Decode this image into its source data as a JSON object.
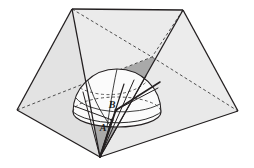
{
  "figure": {
    "background_color": "#ffffff",
    "stroke_color": "#231f20",
    "labels": [
      {
        "id": "A",
        "text": "A",
        "x": 107,
        "y": 128
      },
      {
        "id": "B",
        "text": "B",
        "x": 114,
        "y": 106
      }
    ],
    "colors": {
      "ground_plane": "#a9a9a9",
      "ground_plane_left": "#9e9e9e",
      "roof_left_face": "#e6e6e6",
      "roof_right_face": "#ededed",
      "roof_front_face": "#f2f2f2",
      "dome_fill": "#fbfbfb",
      "dome_base_fill": "#ffffff",
      "outline": "#231f20",
      "hidden_line": "#5a5a5a",
      "label_text": "#1a1a1a"
    },
    "vertices": {
      "apex_left": {
        "x": 72,
        "y": 9
      },
      "apex_right": {
        "x": 183,
        "y": 10
      },
      "base_left": {
        "x": 17,
        "y": 110
      },
      "base_right": {
        "x": 238,
        "y": 111
      },
      "base_front": {
        "x": 100,
        "y": 157
      },
      "base_back": {
        "x": 152,
        "y": 57
      }
    },
    "dome": {
      "center_x": 117,
      "center_y": 112,
      "radius_x": 44,
      "radius_y": 43,
      "base_ellipse_ry": 15
    },
    "line_style": {
      "solid_width": 1.1,
      "hidden_dash": "3,2.5",
      "thick_width": 1.9
    }
  }
}
